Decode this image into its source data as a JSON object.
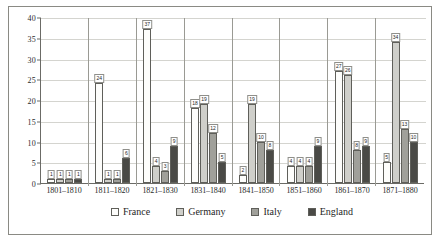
{
  "chart_data": {
    "type": "bar",
    "title": "",
    "subtitle": "",
    "xlabel": "",
    "ylabel": "",
    "ylim": [
      0,
      40
    ],
    "yticks": [
      0,
      5,
      10,
      15,
      20,
      25,
      30,
      35,
      40
    ],
    "grid": true,
    "legend_position": "bottom",
    "categories": [
      "1801–1810",
      "1811–1820",
      "1821–1830",
      "1831–1840",
      "1841–1850",
      "1851–1860",
      "1861–1870",
      "1871–1880"
    ],
    "series": [
      {
        "name": "France",
        "color": "#fdfdfb",
        "values": [
          1,
          24,
          37,
          18,
          2,
          4,
          27,
          5
        ]
      },
      {
        "name": "Germany",
        "color": "#cfcfca",
        "values": [
          1,
          1,
          4,
          19,
          19,
          4,
          26,
          34
        ]
      },
      {
        "name": "Italy",
        "color": "#a0a09a",
        "values": [
          1,
          1,
          3,
          12,
          10,
          4,
          8,
          13
        ]
      },
      {
        "name": "England",
        "color": "#4a4a46",
        "values": [
          1,
          6,
          9,
          5,
          8,
          9,
          9,
          10
        ]
      }
    ]
  }
}
